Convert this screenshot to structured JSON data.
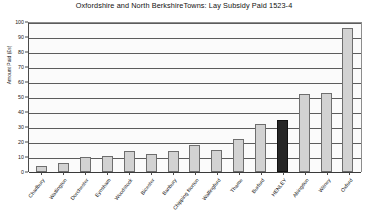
{
  "chart_data": {
    "type": "bar",
    "title": "Oxfordshire and North BerkshireTowns: Lay Subsidy Paid 1523-4",
    "xlabel": "",
    "ylabel": "Amount Paid (£s)",
    "ylim": [
      0,
      100
    ],
    "ytick_step": 10,
    "yticks": [
      0,
      10,
      20,
      30,
      40,
      50,
      60,
      70,
      80,
      90,
      100
    ],
    "ytick_labels": [
      "0",
      "10",
      "20",
      "30",
      "40",
      "50",
      "60",
      "70",
      "80",
      "90",
      "100"
    ],
    "grid": true,
    "legend": "none",
    "categories": [
      "Charlbury",
      "Watlington",
      "Dorchester",
      "Eynsham",
      "Woodstock",
      "Bicester",
      "Banbury",
      "Chipping Norton",
      "Wallingford",
      "Thame",
      "Burford",
      "HENLEY",
      "Abingdon",
      "Witney",
      "Oxford"
    ],
    "values": [
      4,
      6,
      10,
      11,
      14,
      12,
      14,
      18,
      15,
      22,
      32,
      35,
      52,
      53,
      96
    ],
    "highlight_index": 11,
    "bar_color": "#d2d2d2",
    "bar_edge_color": "#6e6e6e",
    "highlight_color": "#262626",
    "background_color": "#ffffff",
    "plot_background_color": "#fbfbfb"
  }
}
